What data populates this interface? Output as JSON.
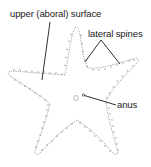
{
  "diagram": {
    "labels": {
      "upper_surface": "upper (aboral) surface",
      "lateral_spines": "lateral spines",
      "anus": "anus"
    },
    "colors": {
      "outline": "#9a9a9a",
      "spines": "#7a7a7a",
      "leader_lines": "#1a1a1a",
      "text": "#1a1a1a",
      "background": "#ffffff"
    }
  }
}
